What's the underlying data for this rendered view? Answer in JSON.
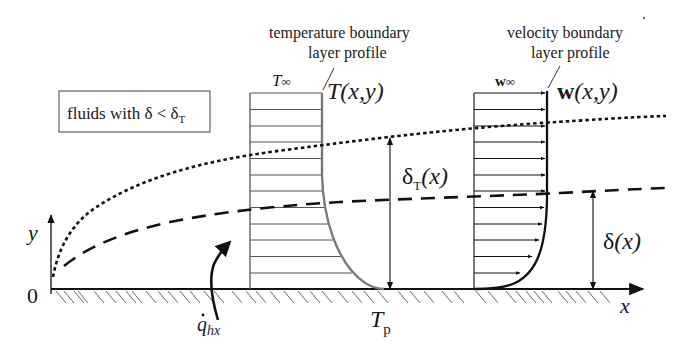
{
  "figure": {
    "type": "boundary-layer-diagram",
    "legend_box": {
      "text_prefix": "fluids with ",
      "delta": "δ",
      "lt": " < ",
      "delta_T": "δ",
      "delta_T_sub": "T"
    },
    "temperature_profile": {
      "caption_line1": "temperature boundary",
      "caption_line2": "layer profile",
      "freestream_label": "T",
      "freestream_sub": "∞",
      "function_label": "T",
      "function_args": "(x,y)",
      "line_color": "#7a7a7a"
    },
    "velocity_profile": {
      "caption_line1": "velocity boundary",
      "caption_line2": "layer profile",
      "freestream_label": "w",
      "freestream_sub": "∞",
      "function_label": "w",
      "function_args": "(x,y)"
    },
    "thickness_labels": {
      "thermal": {
        "symbol": "δ",
        "sub": "T",
        "arg": "(x)"
      },
      "velocity": {
        "symbol": "δ",
        "arg": "(x)"
      }
    },
    "axes": {
      "x_label": "x",
      "y_label": "y",
      "origin_label": "0"
    },
    "wall": {
      "temperature_label": "T",
      "temperature_sub": "p",
      "heat_flux_label": "q",
      "heat_flux_sub": "hx",
      "heat_flux_dot": "˙"
    },
    "curves": {
      "thermal_boundary": "dotted",
      "velocity_boundary": "dashed"
    }
  }
}
